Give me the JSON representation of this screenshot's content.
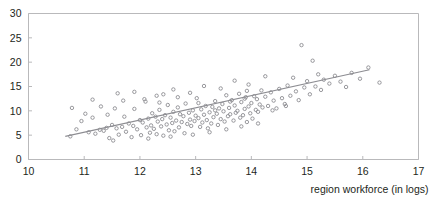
{
  "chart_data": {
    "type": "scatter",
    "title": "",
    "subtitle": "",
    "xlabel": "region workforce (in logs)",
    "ylabel": "",
    "xlim": [
      10,
      17
    ],
    "ylim": [
      0,
      30
    ],
    "xticks": [
      10,
      11,
      12,
      13,
      14,
      15,
      16,
      17
    ],
    "xtick_labels": [
      "10",
      "11",
      "12",
      "13",
      "14",
      "15",
      "16",
      "17"
    ],
    "yticks": [
      0,
      5,
      10,
      15,
      20,
      25,
      30
    ],
    "ytick_labels": [
      "0",
      "5",
      "10",
      "15",
      "20",
      "25",
      "30"
    ],
    "grid": false,
    "legend": null,
    "marker_style": "open-circle",
    "marker_color": "#8d8d92",
    "fit_line": {
      "name": "linear fit",
      "color": "#8d8d92",
      "x_start": 10.66,
      "y_start": 4.75,
      "x_end": 16.12,
      "y_end": 18.45
    },
    "points": [
      [
        10.75,
        4.75
      ],
      [
        10.78,
        10.6
      ],
      [
        10.86,
        6.2
      ],
      [
        10.95,
        7.9
      ],
      [
        11.02,
        9.4
      ],
      [
        11.08,
        5.6
      ],
      [
        11.15,
        12.3
      ],
      [
        11.2,
        5.3
      ],
      [
        11.28,
        6.1
      ],
      [
        11.3,
        10.9
      ],
      [
        11.35,
        5.9
      ],
      [
        11.4,
        6.5
      ],
      [
        11.45,
        4.4
      ],
      [
        11.5,
        7.1
      ],
      [
        11.55,
        10.5
      ],
      [
        11.58,
        6.4
      ],
      [
        11.62,
        5.1
      ],
      [
        11.68,
        6.7
      ],
      [
        11.7,
        12.1
      ],
      [
        11.75,
        5.7
      ],
      [
        11.8,
        7.4
      ],
      [
        11.85,
        4.6
      ],
      [
        11.88,
        6.9
      ],
      [
        11.9,
        10.4
      ],
      [
        11.95,
        6.2
      ],
      [
        12.0,
        8.1
      ],
      [
        12.02,
        5.0
      ],
      [
        12.05,
        7.6
      ],
      [
        12.1,
        11.9
      ],
      [
        12.12,
        6.6
      ],
      [
        12.15,
        8.4
      ],
      [
        12.18,
        5.5
      ],
      [
        12.2,
        7.0
      ],
      [
        12.22,
        9.5
      ],
      [
        12.25,
        6.3
      ],
      [
        12.28,
        8.8
      ],
      [
        12.3,
        5.2
      ],
      [
        12.32,
        7.8
      ],
      [
        12.35,
        10.2
      ],
      [
        12.38,
        6.8
      ],
      [
        12.4,
        8.3
      ],
      [
        12.42,
        4.9
      ],
      [
        12.45,
        9.1
      ],
      [
        12.48,
        7.2
      ],
      [
        12.5,
        11.2
      ],
      [
        12.52,
        6.0
      ],
      [
        12.55,
        8.6
      ],
      [
        12.58,
        7.5
      ],
      [
        12.6,
        9.8
      ],
      [
        12.62,
        5.8
      ],
      [
        12.65,
        8.0
      ],
      [
        12.68,
        10.7
      ],
      [
        12.7,
        6.6
      ],
      [
        12.72,
        9.3
      ],
      [
        12.75,
        7.7
      ],
      [
        12.78,
        8.9
      ],
      [
        12.8,
        5.4
      ],
      [
        12.82,
        11.5
      ],
      [
        12.85,
        7.3
      ],
      [
        12.88,
        9.6
      ],
      [
        12.9,
        8.2
      ],
      [
        12.92,
        6.9
      ],
      [
        12.95,
        10.1
      ],
      [
        12.98,
        7.9
      ],
      [
        13.0,
        9.0
      ],
      [
        13.02,
        12.6
      ],
      [
        13.05,
        8.5
      ],
      [
        13.08,
        6.7
      ],
      [
        13.1,
        10.3
      ],
      [
        13.12,
        7.6
      ],
      [
        13.15,
        9.2
      ],
      [
        13.18,
        11.0
      ],
      [
        13.2,
        8.1
      ],
      [
        13.22,
        6.4
      ],
      [
        13.25,
        9.7
      ],
      [
        13.28,
        7.4
      ],
      [
        13.3,
        10.8
      ],
      [
        13.32,
        8.7
      ],
      [
        13.35,
        12.0
      ],
      [
        13.38,
        9.4
      ],
      [
        13.4,
        7.1
      ],
      [
        13.42,
        10.5
      ],
      [
        13.45,
        8.3
      ],
      [
        13.48,
        11.4
      ],
      [
        13.5,
        9.9
      ],
      [
        13.52,
        7.8
      ],
      [
        13.55,
        13.2
      ],
      [
        13.58,
        8.9
      ],
      [
        13.6,
        10.6
      ],
      [
        13.62,
        9.3
      ],
      [
        13.65,
        12.2
      ],
      [
        13.68,
        8.0
      ],
      [
        13.7,
        11.1
      ],
      [
        13.72,
        9.6
      ],
      [
        13.75,
        10.0
      ],
      [
        13.78,
        13.5
      ],
      [
        13.8,
        8.6
      ],
      [
        13.82,
        11.8
      ],
      [
        13.85,
        9.1
      ],
      [
        13.88,
        10.4
      ],
      [
        13.9,
        12.8
      ],
      [
        13.92,
        7.7
      ],
      [
        13.95,
        10.9
      ],
      [
        13.98,
        9.5
      ],
      [
        14.0,
        11.6
      ],
      [
        14.02,
        8.4
      ],
      [
        14.05,
        13.0
      ],
      [
        14.08,
        10.2
      ],
      [
        14.1,
        12.4
      ],
      [
        14.12,
        9.8
      ],
      [
        14.15,
        11.3
      ],
      [
        14.18,
        14.2
      ],
      [
        14.2,
        10.7
      ],
      [
        14.25,
        12.9
      ],
      [
        14.3,
        11.0
      ],
      [
        14.35,
        13.8
      ],
      [
        14.4,
        12.1
      ],
      [
        14.45,
        10.5
      ],
      [
        14.5,
        14.5
      ],
      [
        14.55,
        12.6
      ],
      [
        14.6,
        11.4
      ],
      [
        14.65,
        15.2
      ],
      [
        14.7,
        13.1
      ],
      [
        14.75,
        16.8
      ],
      [
        14.8,
        14.0
      ],
      [
        14.85,
        12.2
      ],
      [
        14.9,
        23.5
      ],
      [
        14.95,
        14.8
      ],
      [
        15.0,
        16.1
      ],
      [
        15.05,
        13.4
      ],
      [
        15.1,
        20.3
      ],
      [
        15.15,
        15.0
      ],
      [
        15.2,
        17.5
      ],
      [
        15.25,
        14.3
      ],
      [
        15.3,
        16.4
      ],
      [
        15.4,
        15.6
      ],
      [
        15.5,
        17.2
      ],
      [
        15.6,
        16.0
      ],
      [
        15.7,
        14.9
      ],
      [
        15.8,
        17.8
      ],
      [
        15.95,
        16.6
      ],
      [
        16.1,
        18.9
      ],
      [
        16.3,
        15.8
      ],
      [
        11.6,
        13.6
      ],
      [
        11.9,
        13.9
      ],
      [
        12.3,
        13.1
      ],
      [
        12.6,
        14.4
      ],
      [
        12.9,
        13.7
      ],
      [
        13.15,
        15.1
      ],
      [
        13.45,
        14.6
      ],
      [
        13.7,
        16.2
      ],
      [
        13.95,
        15.4
      ],
      [
        14.25,
        17.1
      ],
      [
        11.15,
        8.6
      ],
      [
        11.42,
        9.2
      ],
      [
        11.72,
        8.8
      ],
      [
        12.08,
        12.4
      ],
      [
        12.35,
        11.7
      ],
      [
        12.68,
        12.8
      ],
      [
        13.05,
        11.6
      ],
      [
        13.35,
        10.1
      ],
      [
        13.62,
        11.9
      ],
      [
        13.88,
        12.5
      ],
      [
        12.15,
        4.3
      ],
      [
        12.55,
        4.7
      ],
      [
        12.95,
        5.1
      ],
      [
        13.25,
        5.6
      ],
      [
        13.55,
        6.2
      ],
      [
        13.82,
        6.8
      ],
      [
        14.12,
        7.4
      ],
      [
        11.52,
        3.9
      ],
      [
        12.42,
        13.4
      ],
      [
        13.92,
        14.1
      ],
      [
        14.38,
        10.1
      ],
      [
        14.62,
        11.0
      ]
    ]
  }
}
